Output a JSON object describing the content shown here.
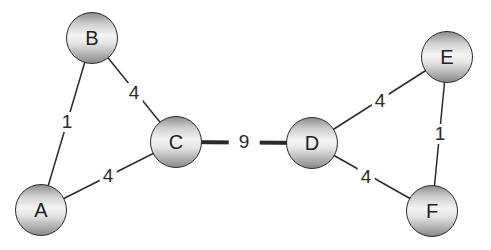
{
  "diagram": {
    "type": "weighted-undirected-graph",
    "nodes": [
      {
        "id": "A",
        "label": "A",
        "x": 41,
        "y": 210
      },
      {
        "id": "B",
        "label": "B",
        "x": 92,
        "y": 38
      },
      {
        "id": "C",
        "label": "C",
        "x": 176,
        "y": 142
      },
      {
        "id": "D",
        "label": "D",
        "x": 312,
        "y": 143
      },
      {
        "id": "E",
        "label": "E",
        "x": 447,
        "y": 57
      },
      {
        "id": "F",
        "label": "F",
        "x": 432,
        "y": 211
      }
    ],
    "edges": [
      {
        "from": "A",
        "to": "B",
        "weight": "1",
        "label_x": 67,
        "label_y": 122,
        "thick": false
      },
      {
        "from": "B",
        "to": "C",
        "weight": "4",
        "label_x": 134,
        "label_y": 93,
        "thick": false
      },
      {
        "from": "A",
        "to": "C",
        "weight": "4",
        "label_x": 108,
        "label_y": 176,
        "thick": false
      },
      {
        "from": "C",
        "to": "D",
        "weight": "9",
        "label_x": 244,
        "label_y": 142,
        "thick": true
      },
      {
        "from": "D",
        "to": "E",
        "weight": "4",
        "label_x": 380,
        "label_y": 101,
        "thick": false
      },
      {
        "from": "D",
        "to": "F",
        "weight": "4",
        "label_x": 366,
        "label_y": 177,
        "thick": false
      },
      {
        "from": "E",
        "to": "F",
        "weight": "1",
        "label_x": 440,
        "label_y": 134,
        "thick": false
      }
    ]
  },
  "colors": {
    "edge": "#2a2a2a",
    "node_outline": "#2b2b2b",
    "label": "#222222",
    "background": "#ffffff"
  }
}
